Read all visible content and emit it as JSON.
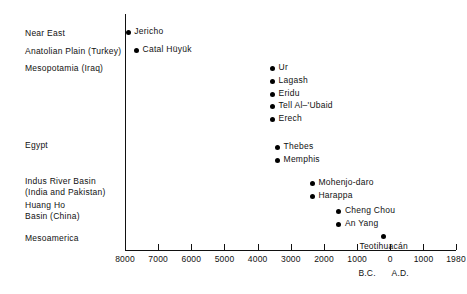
{
  "chart_data": {
    "type": "scatter",
    "title": "",
    "subtitle": "",
    "xlabel": "",
    "ylabel": "",
    "grid": false,
    "legend": "none",
    "x_axis": {
      "ticks": [
        {
          "label": "8000",
          "value": -8000
        },
        {
          "label": "7000",
          "value": -7000
        },
        {
          "label": "6000",
          "value": -6000
        },
        {
          "label": "5000",
          "value": -5000
        },
        {
          "label": "4000",
          "value": -4000
        },
        {
          "label": "3000",
          "value": -3000
        },
        {
          "label": "2000",
          "value": -2000
        },
        {
          "label": "1000",
          "value": -1000
        },
        {
          "label": "0",
          "value": 0
        },
        {
          "label": "1000",
          "value": 1000
        },
        {
          "label": "1980",
          "value": 1980
        }
      ],
      "xlim": [
        -8000,
        1980
      ],
      "era_labels": [
        {
          "label": "B.C.",
          "value": -700
        },
        {
          "label": "A.D.",
          "value": 300
        }
      ]
    },
    "categories": [
      "Near East",
      "Anatolian Plain (Turkey)",
      "Mesopotamia (Iraq)",
      "Egypt",
      "Indus River Basin\n(India and Pakistan)",
      "Huang Ho\nBasin (China)",
      "Mesoamerica"
    ],
    "points": [
      {
        "label": "Jericho",
        "category": "Near East",
        "value": -7900,
        "label_side": "right"
      },
      {
        "label": "Catal Hüyük",
        "category": "Anatolian Plain (Turkey)",
        "value": -7650,
        "label_side": "right"
      },
      {
        "label": "Ur",
        "category": "Mesopotamia (Iraq)",
        "value": -3550,
        "label_side": "right"
      },
      {
        "label": "Lagash",
        "category": "Mesopotamia (Iraq)",
        "value": -3550,
        "label_side": "right"
      },
      {
        "label": "Eridu",
        "category": "Mesopotamia (Iraq)",
        "value": -3550,
        "label_side": "right"
      },
      {
        "label": "Tell Al–'Ubaid",
        "category": "Mesopotamia (Iraq)",
        "value": -3550,
        "label_side": "right"
      },
      {
        "label": "Erech",
        "category": "Mesopotamia (Iraq)",
        "value": -3550,
        "label_side": "right"
      },
      {
        "label": "Thebes",
        "category": "Egypt",
        "value": -3400,
        "label_side": "right"
      },
      {
        "label": "Memphis",
        "category": "Egypt",
        "value": -3400,
        "label_side": "right"
      },
      {
        "label": "Mohenjo-daro",
        "category": "Indus River Basin\n(India and Pakistan)",
        "value": -2350,
        "label_side": "right"
      },
      {
        "label": "Harappa",
        "category": "Indus River Basin\n(India and Pakistan)",
        "value": -2350,
        "label_side": "right"
      },
      {
        "label": "Cheng Chou",
        "category": "Huang Ho\nBasin (China)",
        "value": -1550,
        "label_side": "right"
      },
      {
        "label": "An Yang",
        "category": "Huang Ho\nBasin (China)",
        "value": -1550,
        "label_side": "right"
      },
      {
        "label": "Teotihuacán",
        "category": "Mesoamerica",
        "value": -200,
        "label_side": "below"
      }
    ]
  },
  "layout": {
    "row_labels": [
      {
        "text": "Near East",
        "top": 28
      },
      {
        "text": "Anatolian Plain (Turkey)",
        "top": 46
      },
      {
        "text": "Mesopotamia (Iraq)",
        "top": 63
      },
      {
        "text": "Egypt",
        "top": 140
      },
      {
        "text": "Indus River Basin\n(India and Pakistan)",
        "top": 176
      },
      {
        "text": "Huang Ho\nBasin (China)",
        "top": 200
      },
      {
        "text": "Mesoamerica",
        "top": 233
      }
    ],
    "point_rows": [
      {
        "label": "Jericho",
        "top": 32
      },
      {
        "label": "Catal Hüyük",
        "top": 50
      },
      {
        "label": "Ur",
        "top": 68
      },
      {
        "label": "Lagash",
        "top": 81
      },
      {
        "label": "Eridu",
        "top": 94
      },
      {
        "label": "Tell Al–'Ubaid",
        "top": 106
      },
      {
        "label": "Erech",
        "top": 119
      },
      {
        "label": "Thebes",
        "top": 147
      },
      {
        "label": "Memphis",
        "top": 160
      },
      {
        "label": "Mohenjo-daro",
        "top": 183
      },
      {
        "label": "Harappa",
        "top": 196
      },
      {
        "label": "Cheng Chou",
        "top": 211
      },
      {
        "label": "An Yang",
        "top": 224
      },
      {
        "label": "Teotihuacán",
        "top": 236
      }
    ]
  },
  "colors": {
    "ink": "#111111",
    "point": "#000000",
    "background": "#ffffff"
  }
}
